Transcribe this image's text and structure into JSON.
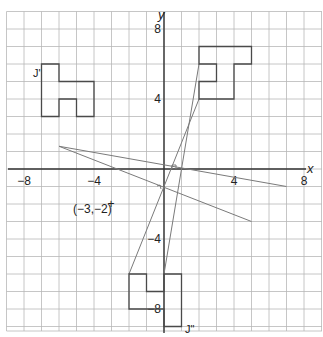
{
  "diagram": {
    "type": "coordinate-grid-transformation",
    "axes": {
      "x_label": "x",
      "y_label": "y",
      "x_ticks": [
        {
          "value": -8,
          "label": "−8"
        },
        {
          "value": -4,
          "label": "−4"
        },
        {
          "value": 4,
          "label": "4"
        },
        {
          "value": 8,
          "label": "8"
        }
      ],
      "y_ticks": [
        {
          "value": 8,
          "label": "8"
        },
        {
          "value": 4,
          "label": "4"
        },
        {
          "value": -4,
          "label": "−4"
        },
        {
          "value": -8,
          "label": "−8"
        }
      ],
      "range": {
        "x": [
          -9,
          9
        ],
        "y": [
          -9,
          9
        ]
      }
    },
    "shapes": [
      {
        "name": "J",
        "label": "",
        "points": [
          [
            2,
            7
          ],
          [
            5,
            7
          ],
          [
            5,
            6
          ],
          [
            4,
            6
          ],
          [
            4,
            4
          ],
          [
            2,
            4
          ],
          [
            2,
            5
          ],
          [
            3,
            5
          ],
          [
            3,
            6
          ],
          [
            2,
            6
          ]
        ]
      },
      {
        "name": "J-prime",
        "label": "J'",
        "points": [
          [
            -7,
            6
          ],
          [
            -6,
            6
          ],
          [
            -6,
            5
          ],
          [
            -4,
            5
          ],
          [
            -4,
            3
          ],
          [
            -5,
            3
          ],
          [
            -5,
            4
          ],
          [
            -6,
            4
          ],
          [
            -6,
            3
          ],
          [
            -7,
            3
          ]
        ]
      },
      {
        "name": "J-double-prime",
        "label": "J\"",
        "points": [
          [
            -2,
            -6
          ],
          [
            -1,
            -6
          ],
          [
            -1,
            -7
          ],
          [
            0,
            -7
          ],
          [
            0,
            -6
          ],
          [
            1,
            -6
          ],
          [
            1,
            -9
          ],
          [
            0,
            -9
          ],
          [
            0,
            -8
          ],
          [
            -2,
            -8
          ]
        ]
      }
    ],
    "construction_lines": [
      {
        "from": [
          2,
          4
        ],
        "to": [
          -2,
          -6
        ]
      },
      {
        "from": [
          2,
          6
        ],
        "to": [
          0,
          -6
        ]
      },
      {
        "from": [
          -6,
          1.3
        ],
        "to": [
          7,
          -1
        ]
      },
      {
        "from": [
          -6,
          1.3
        ],
        "to": [
          5,
          -3
        ]
      }
    ],
    "point": {
      "coords": [
        -3,
        -2
      ],
      "label": "(−3,−2)"
    }
  }
}
